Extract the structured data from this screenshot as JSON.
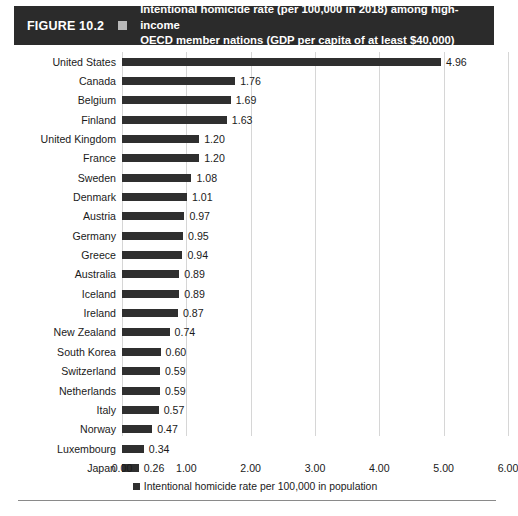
{
  "figure": {
    "number": "FIGURE 10.2",
    "marker_icon": "square-marker-icon",
    "title_line1": "Intentional homicide rate (per 100,000 in 2018) among high-income",
    "title_line2": "OECD member nations (GDP per capita of at least $40,000)",
    "banner_color": "#2b2b2b",
    "banner_text_color": "#ffffff"
  },
  "chart_data": {
    "type": "bar",
    "orientation": "horizontal",
    "title": "Intentional homicide rate (per 100,000 in 2018) among high-income OECD member nations (GDP per capita of at least $40,000)",
    "xlabel": "",
    "ylabel": "",
    "xlim": [
      0,
      6
    ],
    "xticks": [
      "0.00",
      "1.00",
      "2.00",
      "3.00",
      "4.00",
      "5.00",
      "6.00"
    ],
    "xtick_values": [
      0,
      1,
      2,
      3,
      4,
      5,
      6
    ],
    "grid": "vertical",
    "legend_position": "bottom-center",
    "legend": [
      "Intentional homicide rate per 100,000 in population"
    ],
    "series_color": "#2f2f2f",
    "categories": [
      "United States",
      "Canada",
      "Belgium",
      "Finland",
      "United Kingdom",
      "France",
      "Sweden",
      "Denmark",
      "Austria",
      "Germany",
      "Greece",
      "Australia",
      "Iceland",
      "Ireland",
      "New Zealand",
      "South Korea",
      "Switzerland",
      "Netherlands",
      "Italy",
      "Norway",
      "Luxembourg",
      "Japan"
    ],
    "values": [
      4.96,
      1.76,
      1.69,
      1.63,
      1.2,
      1.2,
      1.08,
      1.01,
      0.97,
      0.95,
      0.94,
      0.89,
      0.89,
      0.87,
      0.74,
      0.6,
      0.59,
      0.59,
      0.57,
      0.47,
      0.34,
      0.26
    ],
    "labels": [
      "4.96",
      "1.76",
      "1.69",
      "1.63",
      "1.20",
      "1.20",
      "1.08",
      "1.01",
      "0.97",
      "0.95",
      "0.94",
      "0.89",
      "0.89",
      "0.87",
      "0.74",
      "0.60",
      "0.59",
      "0.59",
      "0.57",
      "0.47",
      "0.34",
      "0.26"
    ]
  }
}
